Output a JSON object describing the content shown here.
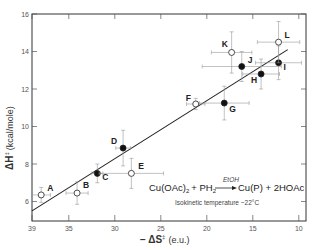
{
  "chart_data": {
    "type": "scatter",
    "title": "",
    "xlabel": "− ΔS‡ (e.u.)",
    "ylabel": "ΔH‡ (kcal/mole)",
    "xlim": [
      39,
      9.3
    ],
    "ylim": [
      5,
      16
    ],
    "x_reversed": true,
    "x_ticks": [
      39,
      35,
      30,
      25,
      20,
      15,
      10
    ],
    "y_ticks": [
      6,
      8,
      10,
      12,
      14,
      16
    ],
    "grid": false,
    "legend": null,
    "points": [
      {
        "label": "A",
        "x": 38.0,
        "y": 6.35,
        "filled": false,
        "xerr": 1.0,
        "yerr": 0.4
      },
      {
        "label": "B",
        "x": 34.1,
        "y": 6.45,
        "filled": false,
        "xerr": 1.2,
        "yerr": 0.6
      },
      {
        "label": "C",
        "x": 31.9,
        "y": 7.5,
        "filled": true,
        "xerr": 0.6,
        "yerr": 0.5
      },
      {
        "label": "D",
        "x": 29.1,
        "y": 8.85,
        "filled": true,
        "xerr": 0.8,
        "yerr": 0.95
      },
      {
        "label": "E",
        "x": 28.2,
        "y": 7.5,
        "filled": false,
        "xerr": 3.5,
        "yerr": 0.8
      },
      {
        "label": "F",
        "x": 21.2,
        "y": 11.2,
        "filled": false,
        "xerr": 1.0,
        "yerr": 0.3
      },
      {
        "label": "G",
        "x": 18.1,
        "y": 11.25,
        "filled": true,
        "xerr": 2.7,
        "yerr": 0.9
      },
      {
        "label": "H",
        "x": 14.1,
        "y": 12.8,
        "filled": true,
        "xerr": 2.0,
        "yerr": 0.8
      },
      {
        "label": "I",
        "x": 12.2,
        "y": 13.4,
        "filled": true,
        "xerr": 2.5,
        "yerr": 0.9
      },
      {
        "label": "J",
        "x": 16.2,
        "y": 13.2,
        "filled": true,
        "xerr": 4.3,
        "yerr": 0.8
      },
      {
        "label": "K",
        "x": 17.3,
        "y": 13.95,
        "filled": false,
        "xerr": 2.2,
        "yerr": 1.1
      },
      {
        "label": "L",
        "x": 12.2,
        "y": 14.5,
        "filled": false,
        "xerr": 2.3,
        "yerr": 1.1
      }
    ],
    "fit_line": {
      "x": [
        39,
        11.2
      ],
      "y": [
        5.5,
        14.1
      ]
    },
    "annotations": [
      "Cu(OAc)2 + PH2 —EtOH→ Cu(P) + 2HOAc",
      "Isokinetic temperature ~22°C"
    ]
  },
  "labels": {
    "xlabel_prefix": "− ΔS",
    "xlabel_sup": "‡",
    "xlabel_unit": "(e.u.)",
    "ylabel_main": "ΔH",
    "ylabel_sup": "‡",
    "ylabel_unit": "(kcal/mole)",
    "eq_left": "Cu(OAc)",
    "eq_sub2": "2",
    "eq_plus": "+ PH",
    "eq_sub2b": "2",
    "eq_solvent": "EtOH",
    "eq_right": "Cu(P) + 2HOAc",
    "note": "Isokinetic temperature  ~22°C"
  }
}
